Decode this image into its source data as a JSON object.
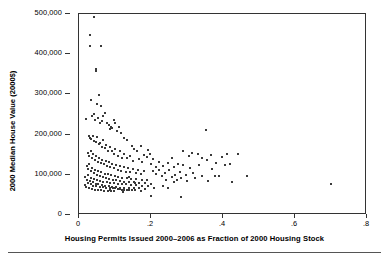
{
  "chart_data": {
    "type": "scatter",
    "title": "",
    "xlabel": "Housing Permits Issued 2000–2006 as Fraction of 2000 Housing Stock",
    "ylabel": "2000 Median House Value (2000$)",
    "xlim": [
      0,
      0.8
    ],
    "ylim": [
      0,
      500000
    ],
    "xticks": [
      0,
      0.2,
      0.4,
      0.6,
      0.8
    ],
    "xtick_labels": [
      "0",
      ".2",
      ".4",
      ".6",
      ".8"
    ],
    "yticks": [
      0,
      100000,
      200000,
      300000,
      400000,
      500000
    ],
    "ytick_labels": [
      "0",
      "100,000",
      "200,000",
      "300,000",
      "400,000",
      "500,000"
    ],
    "grid": false,
    "legend": false,
    "marker": "small-square",
    "marker_color": "#3a3a3a",
    "n_points": 244,
    "points": [
      [
        0.041,
        492000
      ],
      [
        0.031,
        449000
      ],
      [
        0.03,
        420000
      ],
      [
        0.06,
        420000
      ],
      [
        0.047,
        364000
      ],
      [
        0.047,
        357000
      ],
      [
        0.034,
        285000
      ],
      [
        0.055,
        299000
      ],
      [
        0.05,
        275000
      ],
      [
        0.062,
        272000
      ],
      [
        0.019,
        239000
      ],
      [
        0.036,
        247000
      ],
      [
        0.041,
        252000
      ],
      [
        0.045,
        236000
      ],
      [
        0.052,
        241000
      ],
      [
        0.057,
        228000
      ],
      [
        0.063,
        233000
      ],
      [
        0.068,
        246000
      ],
      [
        0.072,
        254000
      ],
      [
        0.077,
        229000
      ],
      [
        0.082,
        225000
      ],
      [
        0.085,
        213000
      ],
      [
        0.089,
        220000
      ],
      [
        0.093,
        216000
      ],
      [
        0.097,
        237000
      ],
      [
        0.101,
        228000
      ],
      [
        0.106,
        210000
      ],
      [
        0.112,
        218000
      ],
      [
        0.118,
        203000
      ],
      [
        0.125,
        192000
      ],
      [
        0.132,
        186000
      ],
      [
        0.027,
        196000
      ],
      [
        0.031,
        191000
      ],
      [
        0.034,
        188000
      ],
      [
        0.038,
        197000
      ],
      [
        0.042,
        185000
      ],
      [
        0.046,
        182000
      ],
      [
        0.05,
        194000
      ],
      [
        0.055,
        176000
      ],
      [
        0.059,
        178000
      ],
      [
        0.063,
        170000
      ],
      [
        0.067,
        186000
      ],
      [
        0.072,
        166000
      ],
      [
        0.076,
        173000
      ],
      [
        0.081,
        160000
      ],
      [
        0.086,
        169000
      ],
      [
        0.091,
        159000
      ],
      [
        0.096,
        152000
      ],
      [
        0.101,
        163000
      ],
      [
        0.107,
        148000
      ],
      [
        0.113,
        158000
      ],
      [
        0.119,
        143000
      ],
      [
        0.126,
        151000
      ],
      [
        0.134,
        141000
      ],
      [
        0.142,
        147000
      ],
      [
        0.15,
        135000
      ],
      [
        0.024,
        155000
      ],
      [
        0.028,
        148000
      ],
      [
        0.032,
        160000
      ],
      [
        0.036,
        143000
      ],
      [
        0.04,
        151000
      ],
      [
        0.044,
        138000
      ],
      [
        0.048,
        146000
      ],
      [
        0.052,
        133000
      ],
      [
        0.056,
        141000
      ],
      [
        0.061,
        129000
      ],
      [
        0.065,
        137000
      ],
      [
        0.069,
        126000
      ],
      [
        0.074,
        134000
      ],
      [
        0.078,
        122000
      ],
      [
        0.083,
        131000
      ],
      [
        0.087,
        119000
      ],
      [
        0.092,
        128000
      ],
      [
        0.097,
        116000
      ],
      [
        0.102,
        125000
      ],
      [
        0.107,
        113000
      ],
      [
        0.113,
        122000
      ],
      [
        0.118,
        110000
      ],
      [
        0.124,
        119000
      ],
      [
        0.13,
        108000
      ],
      [
        0.136,
        117000
      ],
      [
        0.143,
        106000
      ],
      [
        0.15,
        114000
      ],
      [
        0.157,
        104000
      ],
      [
        0.164,
        112000
      ],
      [
        0.172,
        102000
      ],
      [
        0.18,
        110000
      ],
      [
        0.021,
        122000
      ],
      [
        0.025,
        115000
      ],
      [
        0.029,
        126000
      ],
      [
        0.033,
        109000
      ],
      [
        0.037,
        118000
      ],
      [
        0.041,
        104000
      ],
      [
        0.045,
        113000
      ],
      [
        0.049,
        100000
      ],
      [
        0.053,
        109000
      ],
      [
        0.058,
        97000
      ],
      [
        0.062,
        106000
      ],
      [
        0.066,
        95000
      ],
      [
        0.071,
        103000
      ],
      [
        0.075,
        92000
      ],
      [
        0.08,
        101000
      ],
      [
        0.084,
        90000
      ],
      [
        0.089,
        99000
      ],
      [
        0.094,
        88000
      ],
      [
        0.099,
        97000
      ],
      [
        0.104,
        86000
      ],
      [
        0.109,
        95000
      ],
      [
        0.114,
        85000
      ],
      [
        0.12,
        93000
      ],
      [
        0.126,
        83000
      ],
      [
        0.132,
        92000
      ],
      [
        0.138,
        82000
      ],
      [
        0.145,
        90000
      ],
      [
        0.152,
        81000
      ],
      [
        0.159,
        89000
      ],
      [
        0.166,
        80000
      ],
      [
        0.174,
        88000
      ],
      [
        0.182,
        79000
      ],
      [
        0.19,
        87000
      ],
      [
        0.199,
        78000
      ],
      [
        0.018,
        95000
      ],
      [
        0.022,
        88000
      ],
      [
        0.026,
        99000
      ],
      [
        0.03,
        85000
      ],
      [
        0.034,
        93000
      ],
      [
        0.038,
        81000
      ],
      [
        0.042,
        90000
      ],
      [
        0.046,
        78000
      ],
      [
        0.05,
        87000
      ],
      [
        0.054,
        76000
      ],
      [
        0.059,
        85000
      ],
      [
        0.063,
        74000
      ],
      [
        0.068,
        83000
      ],
      [
        0.072,
        73000
      ],
      [
        0.077,
        82000
      ],
      [
        0.082,
        71000
      ],
      [
        0.087,
        80000
      ],
      [
        0.092,
        70000
      ],
      [
        0.097,
        79000
      ],
      [
        0.102,
        69000
      ],
      [
        0.108,
        78000
      ],
      [
        0.113,
        68000
      ],
      [
        0.119,
        77000
      ],
      [
        0.125,
        67000
      ],
      [
        0.131,
        76000
      ],
      [
        0.138,
        67000
      ],
      [
        0.145,
        75000
      ],
      [
        0.152,
        66000
      ],
      [
        0.159,
        74000
      ],
      [
        0.167,
        66000
      ],
      [
        0.175,
        73000
      ],
      [
        0.183,
        65000
      ],
      [
        0.192,
        72000
      ],
      [
        0.016,
        75000
      ],
      [
        0.02,
        69000
      ],
      [
        0.024,
        80000
      ],
      [
        0.028,
        67000
      ],
      [
        0.032,
        76000
      ],
      [
        0.036,
        65000
      ],
      [
        0.04,
        73000
      ],
      [
        0.044,
        63000
      ],
      [
        0.048,
        71000
      ],
      [
        0.052,
        62000
      ],
      [
        0.057,
        70000
      ],
      [
        0.061,
        61000
      ],
      [
        0.066,
        69000
      ],
      [
        0.07,
        60000
      ],
      [
        0.075,
        68000
      ],
      [
        0.08,
        60000
      ],
      [
        0.085,
        67000
      ],
      [
        0.09,
        59000
      ],
      [
        0.095,
        66000
      ],
      [
        0.101,
        66000
      ],
      [
        0.107,
        64000
      ],
      [
        0.113,
        64000
      ],
      [
        0.119,
        63000
      ],
      [
        0.126,
        63000
      ],
      [
        0.133,
        62000
      ],
      [
        0.14,
        62000
      ],
      [
        0.148,
        61000
      ],
      [
        0.156,
        61000
      ],
      [
        0.146,
        172000
      ],
      [
        0.154,
        165000
      ],
      [
        0.162,
        158000
      ],
      [
        0.171,
        171000
      ],
      [
        0.181,
        150000
      ],
      [
        0.191,
        162000
      ],
      [
        0.166,
        140000
      ],
      [
        0.176,
        133000
      ],
      [
        0.188,
        144000
      ],
      [
        0.2,
        128000
      ],
      [
        0.198,
        152000
      ],
      [
        0.206,
        139000
      ],
      [
        0.214,
        120000
      ],
      [
        0.206,
        110000
      ],
      [
        0.214,
        101000
      ],
      [
        0.222,
        132000
      ],
      [
        0.223,
        113000
      ],
      [
        0.231,
        96000
      ],
      [
        0.232,
        122000
      ],
      [
        0.24,
        104000
      ],
      [
        0.241,
        88000
      ],
      [
        0.248,
        129000
      ],
      [
        0.25,
        112000
      ],
      [
        0.257,
        94000
      ],
      [
        0.258,
        141000
      ],
      [
        0.265,
        119000
      ],
      [
        0.266,
        100000
      ],
      [
        0.272,
        86000
      ],
      [
        0.274,
        128000
      ],
      [
        0.281,
        107000
      ],
      [
        0.283,
        91000
      ],
      [
        0.29,
        160000
      ],
      [
        0.29,
        125000
      ],
      [
        0.297,
        99000
      ],
      [
        0.299,
        84000
      ],
      [
        0.306,
        147000
      ],
      [
        0.307,
        118000
      ],
      [
        0.315,
        155000
      ],
      [
        0.316,
        104000
      ],
      [
        0.323,
        92000
      ],
      [
        0.331,
        152000
      ],
      [
        0.333,
        124000
      ],
      [
        0.341,
        143000
      ],
      [
        0.343,
        97000
      ],
      [
        0.352,
        211000
      ],
      [
        0.356,
        136000
      ],
      [
        0.359,
        85000
      ],
      [
        0.366,
        149000
      ],
      [
        0.369,
        115000
      ],
      [
        0.377,
        98000
      ],
      [
        0.381,
        130000
      ],
      [
        0.39,
        96000
      ],
      [
        0.396,
        145000
      ],
      [
        0.405,
        124000
      ],
      [
        0.412,
        152000
      ],
      [
        0.419,
        128000
      ],
      [
        0.426,
        83000
      ],
      [
        0.441,
        151000
      ],
      [
        0.466,
        98000
      ],
      [
        0.7,
        77000
      ],
      [
        0.2,
        48000
      ],
      [
        0.282,
        46000
      ],
      [
        0.232,
        72000
      ],
      [
        0.173,
        60000
      ],
      [
        0.122,
        58000
      ],
      [
        0.096,
        60000
      ],
      [
        0.086,
        62000
      ],
      [
        0.208,
        68000
      ],
      [
        0.247,
        66000
      ],
      [
        0.264,
        82000
      ],
      [
        0.155,
        80000
      ],
      [
        0.139,
        94000
      ]
    ]
  }
}
